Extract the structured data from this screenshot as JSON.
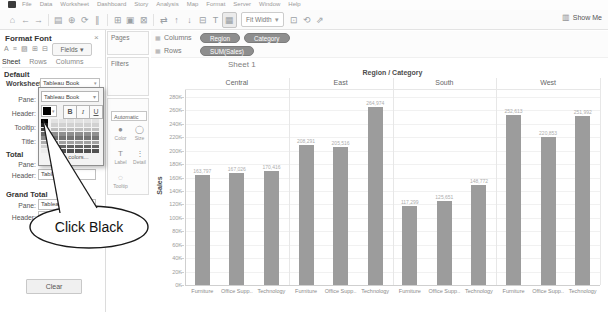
{
  "menu": {
    "items": [
      "File",
      "Data",
      "Worksheet",
      "Dashboard",
      "Story",
      "Analysis",
      "Map",
      "Format",
      "Server",
      "Window",
      "Help"
    ]
  },
  "toolbar": {
    "icon_groups_left": [
      [
        {
          "name": "start-page-icon",
          "glyph": "⌂"
        },
        {
          "name": "undo-icon",
          "glyph": "←"
        },
        {
          "name": "redo-icon",
          "glyph": "→"
        }
      ],
      [
        {
          "name": "save-icon",
          "glyph": "▤"
        },
        {
          "name": "add-data-icon",
          "glyph": "⊕"
        },
        {
          "name": "refresh-icon",
          "glyph": "⟳"
        },
        {
          "name": "pause-icon",
          "glyph": "∥"
        }
      ],
      [
        {
          "name": "new-worksheet-icon",
          "glyph": "⊞"
        },
        {
          "name": "duplicate-sheet-icon",
          "glyph": "▣"
        },
        {
          "name": "clear-sheet-icon",
          "glyph": "⊠"
        }
      ],
      [
        {
          "name": "swap-icon",
          "glyph": "⇄"
        },
        {
          "name": "sort-ascending-icon",
          "glyph": "↑"
        },
        {
          "name": "sort-descending-icon",
          "glyph": "↓"
        },
        {
          "name": "group-icon",
          "glyph": "⊟"
        },
        {
          "name": "show-labels-icon",
          "glyph": "T"
        },
        {
          "name": "highlight-table-icon",
          "glyph": "▦",
          "pressed": true
        }
      ]
    ],
    "icons_right": [
      {
        "name": "fix-axes-icon",
        "glyph": "⊡"
      },
      {
        "name": "reset-icon",
        "glyph": "⟲"
      },
      {
        "name": "share-icon",
        "glyph": "⇗"
      }
    ],
    "fit_value": "Fit Width",
    "fit_chevron": "▾",
    "show_me": "Show Me"
  },
  "format_pane": {
    "title": "Format Font",
    "close_glyph": "×",
    "tools": [
      {
        "name": "font-icon",
        "glyph": "A"
      },
      {
        "name": "alignment-icon",
        "glyph": "≡"
      },
      {
        "name": "shading-icon",
        "glyph": "▨"
      },
      {
        "name": "borders-icon",
        "glyph": "⊞"
      },
      {
        "name": "lines-icon",
        "glyph": "⊟"
      }
    ],
    "fields_label": "Fields ▾",
    "tabs": [
      "Sheet",
      "Rows",
      "Columns"
    ],
    "default_label": "Default",
    "worksheet_label": "Worksheet:",
    "worksheet_value": "Tableau Book",
    "default_rows": [
      "Pane:",
      "Header:",
      "Tooltip:",
      "Title:"
    ],
    "total_label": "Total",
    "total_pane_label": "Pane:",
    "total_header_label": "Header:",
    "total_header_value": "Tableau B..",
    "grand_total_label": "Grand Total",
    "gt_pane_label": "Pane:",
    "gt_pane_value": "Tableau Me..",
    "gt_header_label": "Header:",
    "gt_header_value": "Tableau Boo..",
    "clear_label": "Clear"
  },
  "font_popup": {
    "font_value": "Tableau Book",
    "bold": "B",
    "italic": "I",
    "underline": "U",
    "selected_color": "#000000",
    "more_colors": "More colors...",
    "palette": {
      "gray_column": [
        "#000000",
        "#232323",
        "#454545",
        "#686868",
        "#8b8b8b",
        "#aeaeae",
        "#d1d1d1",
        "#ececec"
      ],
      "color_rows": [
        "#e2e2e2",
        "#d1d1d1",
        "#bfbfbf",
        "#8f8f8f",
        "#747474",
        "#a1a1a1",
        "#636363",
        "#515151"
      ],
      "num_color_columns": 6
    }
  },
  "cards": {
    "pages_label": "Pages",
    "filters_label": "Filters",
    "marks_dropdown": "Automatic",
    "marks_items": [
      {
        "name": "color",
        "label": "Color",
        "glyph": "●"
      },
      {
        "name": "size",
        "label": "Size",
        "glyph": "◯"
      },
      {
        "name": "label",
        "label": "Label",
        "glyph": "T"
      },
      {
        "name": "detail",
        "label": "Detail",
        "glyph": "⋮"
      },
      {
        "name": "tooltip",
        "label": "Tooltip",
        "glyph": "◌"
      }
    ]
  },
  "shelves": {
    "columns_label": "Columns",
    "rows_label": "Rows",
    "columns_pills": [
      "Region",
      "Category"
    ],
    "rows_pills": [
      "SUM(Sales)"
    ]
  },
  "sheet": {
    "title": "Sheet 1"
  },
  "callout": {
    "text": "Click Black"
  },
  "chart_data": {
    "type": "bar",
    "title": "Region / Category",
    "ylabel": "Sales",
    "ylim": [
      0,
      280000
    ],
    "ytick_step": 20000,
    "categories": [
      "Furniture",
      "Office Supp..",
      "Technology"
    ],
    "groups": [
      {
        "name": "Central",
        "values": [
          163797,
          167026,
          170416
        ],
        "labels": [
          "163,797",
          "167,026",
          "170,416"
        ]
      },
      {
        "name": "East",
        "values": [
          208291,
          205516,
          264974
        ],
        "labels": [
          "208,291",
          "205,516",
          "264,974"
        ]
      },
      {
        "name": "South",
        "values": [
          117299,
          125651,
          148772
        ],
        "labels": [
          "117,299",
          "125,651",
          "148,772"
        ]
      },
      {
        "name": "West",
        "values": [
          252613,
          220853,
          251992
        ],
        "labels": [
          "252,613",
          "220,853",
          "251,992"
        ]
      }
    ],
    "bar_color": "#9c9c9c",
    "grid": true,
    "legend": "none"
  }
}
